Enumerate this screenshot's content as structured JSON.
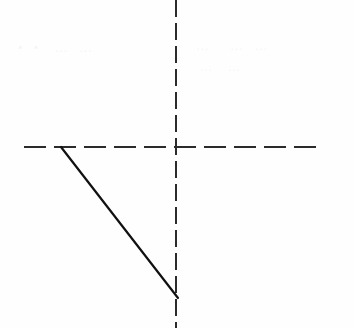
{
  "page": {
    "width": 354,
    "height": 328,
    "background_color": "#fefefe",
    "kind": "scanned-line-diagram"
  },
  "colors": {
    "background": "#fefefe",
    "axis_stroke": "#2b2b2b",
    "line_stroke": "#111111",
    "ghost_ink": "#000000"
  },
  "figure": {
    "origin": {
      "x": 176,
      "y": 147
    },
    "vertical_axis": {
      "label": "vertical-dashed-axis",
      "x": 176,
      "y_start": 0,
      "y_end": 328,
      "stroke_width": 1.8,
      "dash": "17 6",
      "color": "#2b2b2b"
    },
    "horizontal_axis": {
      "label": "horizontal-dashed-axis",
      "y": 147,
      "x_start": 24,
      "x_end": 323,
      "stroke_width": 1.8,
      "dash": "22 8",
      "color": "#2b2b2b"
    },
    "solid_line": {
      "label": "solid-diagonal-segment",
      "x1": 61,
      "y1": 147,
      "x2": 178,
      "y2": 298,
      "stroke_width": 2.2,
      "color": "#111111",
      "style": "solid"
    }
  },
  "ghost_artifacts": {
    "note": "faint show-through ink from reverse of page; illegible",
    "rows": [
      {
        "text": "•  •   …  …",
        "left": 18,
        "top": 40
      },
      {
        "text": "…    …  …",
        "left": 196,
        "top": 38
      },
      {
        "text": "…   …",
        "left": 200,
        "top": 60
      }
    ]
  }
}
